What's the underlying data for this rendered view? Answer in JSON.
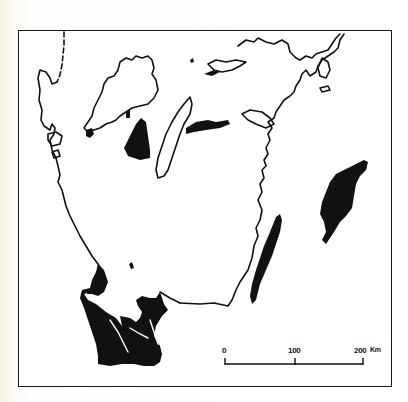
{
  "figure": {
    "type": "map",
    "region": "southern Sweden",
    "style": "black-and-white line map",
    "colors": {
      "ink": "#111111",
      "paper": "#ffffff",
      "margin": "#f8f3df"
    }
  },
  "scale_bar": {
    "ticks": [
      "0",
      "100",
      "200"
    ],
    "unit": "Km",
    "end_label": "200 Km"
  }
}
